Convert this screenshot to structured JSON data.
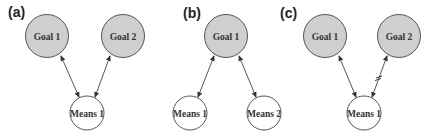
{
  "colors": {
    "goal_fill": "#cfcfcf",
    "means_fill": "#ffffff",
    "stroke": "#555555",
    "edge": "#444444"
  },
  "panels": [
    {
      "label": "(a)",
      "nodes": [
        {
          "id": "goal1",
          "type": "goal",
          "text": "Goal 1"
        },
        {
          "id": "goal2",
          "type": "goal",
          "text": "Goal 2"
        },
        {
          "id": "means1",
          "type": "means",
          "text": "Means 1"
        }
      ],
      "edges": [
        {
          "from": "goal1",
          "to": "means1",
          "type": "bidirectional"
        },
        {
          "from": "goal2",
          "to": "means1",
          "type": "bidirectional"
        }
      ]
    },
    {
      "label": "(b)",
      "nodes": [
        {
          "id": "goal1",
          "type": "goal",
          "text": "Goal 1"
        },
        {
          "id": "means1",
          "type": "means",
          "text": "Means 1"
        },
        {
          "id": "means2",
          "type": "means",
          "text": "Means 2"
        }
      ],
      "edges": [
        {
          "from": "goal1",
          "to": "means1",
          "type": "bidirectional"
        },
        {
          "from": "goal1",
          "to": "means2",
          "type": "bidirectional"
        }
      ]
    },
    {
      "label": "(c)",
      "nodes": [
        {
          "id": "goal1",
          "type": "goal",
          "text": "Goal 1"
        },
        {
          "id": "goal2",
          "type": "goal",
          "text": "Goal 2"
        },
        {
          "id": "means1",
          "type": "means",
          "text": "Means 1"
        }
      ],
      "edges": [
        {
          "from": "goal1",
          "to": "means1",
          "type": "bidirectional"
        },
        {
          "from": "goal2",
          "to": "means1",
          "type": "bidirectional-inhibited"
        }
      ]
    }
  ]
}
